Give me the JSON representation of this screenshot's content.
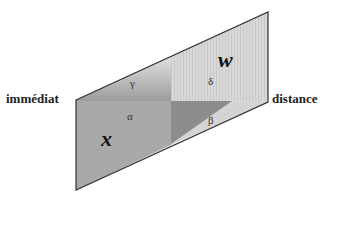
{
  "diagram": {
    "labels": {
      "left": "immédiat",
      "right": "distance",
      "x": "x",
      "w": "w",
      "alpha": "α",
      "beta": "β",
      "gamma": "γ",
      "delta": "δ"
    },
    "colors": {
      "quadrant_x": "#a9a9a9",
      "quadrant_w": "#d6d6d6",
      "triangle_dark": "#8c8c8c",
      "gradient_top": "#e4e4e4",
      "outline": "#333333"
    }
  }
}
